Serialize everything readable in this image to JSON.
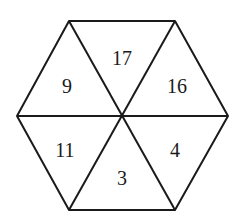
{
  "diagram": {
    "shape": "regular hexagon divided into 6 triangles",
    "stroke_color": "#1a1a1a",
    "triangles": [
      {
        "position": "upper-left",
        "value": "9"
      },
      {
        "position": "top",
        "value": "17"
      },
      {
        "position": "upper-right",
        "value": "16"
      },
      {
        "position": "lower-left",
        "value": "11"
      },
      {
        "position": "bottom",
        "value": "3"
      },
      {
        "position": "lower-right",
        "value": "4"
      }
    ]
  }
}
